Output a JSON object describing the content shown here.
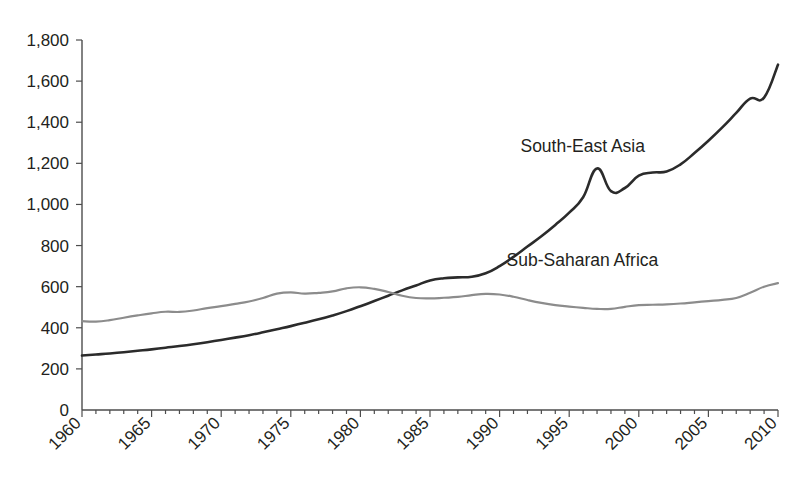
{
  "chart_data": {
    "type": "line",
    "title": "",
    "subtitle": "",
    "xlabel": "",
    "ylabel": "",
    "xlim": [
      1960,
      2010
    ],
    "ylim": [
      0,
      1800
    ],
    "grid": false,
    "legend_position": "inline-annotation",
    "y_ticks": [
      0,
      200,
      400,
      600,
      800,
      1000,
      1200,
      1400,
      1600,
      1800
    ],
    "y_tick_labels": [
      "0",
      "200",
      "400",
      "600",
      "800",
      "1,000",
      "1,200",
      "1,400",
      "1,600",
      "1,800"
    ],
    "x_ticks": [
      1960,
      1965,
      1970,
      1975,
      1980,
      1985,
      1990,
      1995,
      2000,
      2005,
      2010
    ],
    "x_tick_labels": [
      "1960",
      "1965",
      "1970",
      "1975",
      "1980",
      "1985",
      "1990",
      "1995",
      "2000",
      "2005",
      "2010"
    ],
    "x_minor_tick_step": 1,
    "x": [
      1960,
      1961,
      1962,
      1963,
      1964,
      1965,
      1966,
      1967,
      1968,
      1969,
      1970,
      1971,
      1972,
      1973,
      1974,
      1975,
      1976,
      1977,
      1978,
      1979,
      1980,
      1981,
      1982,
      1983,
      1984,
      1985,
      1986,
      1987,
      1988,
      1989,
      1990,
      1991,
      1992,
      1993,
      1994,
      1995,
      1996,
      1997,
      1998,
      1999,
      2000,
      2001,
      2002,
      2003,
      2004,
      2005,
      2006,
      2007,
      2008,
      2009,
      2010
    ],
    "series": [
      {
        "name": "South-East Asia",
        "color": "#2b2b2b",
        "line_width": 2.6,
        "label_x": 1991.5,
        "label_y": 1255,
        "values": [
          265,
          270,
          275,
          281,
          288,
          295,
          303,
          311,
          320,
          330,
          341,
          352,
          364,
          378,
          393,
          408,
          424,
          441,
          460,
          481,
          505,
          530,
          556,
          582,
          606,
          630,
          641,
          645,
          648,
          665,
          700,
          745,
          795,
          845,
          900,
          960,
          1035,
          1175,
          1065,
          1080,
          1140,
          1155,
          1160,
          1195,
          1250,
          1310,
          1375,
          1445,
          1515,
          1520,
          1680
        ]
      },
      {
        "name": "Sub-Saharan Africa",
        "color": "#8c8c8c",
        "line_width": 2.2,
        "label_x": 1990.5,
        "label_y": 700,
        "values": [
          432,
          430,
          437,
          449,
          460,
          470,
          478,
          477,
          484,
          496,
          505,
          516,
          528,
          545,
          566,
          572,
          566,
          570,
          577,
          592,
          597,
          589,
          574,
          556,
          545,
          543,
          546,
          550,
          559,
          565,
          562,
          551,
          535,
          521,
          510,
          503,
          497,
          492,
          492,
          502,
          510,
          512,
          514,
          518,
          524,
          530,
          536,
          545,
          570,
          600,
          617
        ]
      }
    ],
    "annotations": [
      {
        "text": "South-East Asia",
        "name": "series-label-south-east-asia"
      },
      {
        "text": "Sub-Saharan Africa",
        "name": "series-label-sub-saharan-africa"
      }
    ]
  },
  "colors": {
    "background": "#ffffff",
    "axis": "#4d4d4d",
    "text": "#231f20"
  }
}
